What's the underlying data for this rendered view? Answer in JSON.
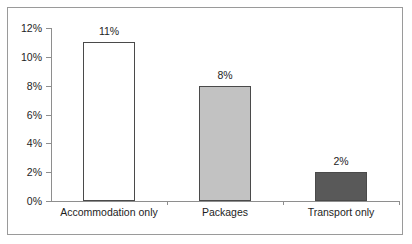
{
  "chart_data": {
    "type": "bar",
    "title": "",
    "xlabel": "",
    "ylabel": "",
    "categories": [
      "Accommodation only",
      "Packages",
      "Transport only"
    ],
    "values": [
      11,
      8,
      2
    ],
    "value_labels": [
      "11%",
      "8%",
      "2%"
    ],
    "ylim": [
      0,
      12
    ],
    "ytick_values": [
      0,
      2,
      4,
      6,
      8,
      10,
      12
    ],
    "ytick_labels": [
      "0%",
      "2%",
      "4%",
      "6%",
      "8%",
      "10%",
      "12%"
    ],
    "grid": false,
    "legend": null,
    "bar_colors": [
      "#ffffff",
      "#c2c2c2",
      "#595959"
    ],
    "bar_border_color": "#4a4a4a",
    "axis_color": "#8e8e8e",
    "frame_color": "#9a9a9a",
    "text_color": "#1d1d1d"
  }
}
